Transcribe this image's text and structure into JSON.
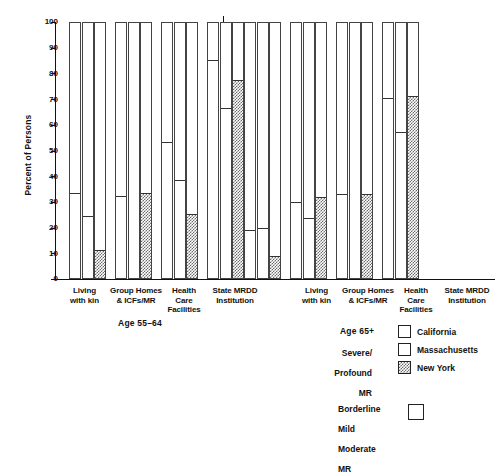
{
  "chart_data": {
    "type": "bar",
    "title": "",
    "ylabel": "Percent of Persons",
    "xlabel": "",
    "ylim": [
      0,
      100
    ],
    "ytick_step": 10,
    "yticks": [
      100,
      90,
      80,
      70,
      60,
      50,
      40,
      30,
      20,
      10,
      0
    ],
    "grid": false,
    "legend_position": "bottom-right",
    "note": "Stacked/overlaid 100% bars; shaded lower portion = Severe/Profound MR, unshaded remainder to 100 = Borderline/Mild/Moderate MR",
    "panels": [
      {
        "name": "Age 55-64",
        "label": "Age 55–64",
        "categories": [
          "Living with kin",
          "Group Homes & ICFs/MR",
          "Health Care Facilities",
          "State MRDD Institution"
        ],
        "series": [
          {
            "name": "California",
            "values": [
              33,
              32,
              53,
              85
            ]
          },
          {
            "name": "Massachusetts",
            "values": [
              24,
              0,
              38,
              66
            ]
          },
          {
            "name": "New York",
            "values": [
              11,
              33,
              25,
              77
            ]
          }
        ]
      },
      {
        "name": "Age 65+",
        "label": "Age 65+",
        "categories": [
          "Living with kin",
          "Group Homes & ICFs/MR",
          "Health Care Facilities",
          "State MRDD Institution"
        ],
        "series": [
          {
            "name": "California",
            "values": [
              18.5,
              29.5,
              32.5,
              70
            ]
          },
          {
            "name": "Massachusetts",
            "values": [
              19.5,
              23.5,
              0,
              57
            ]
          },
          {
            "name": "New York",
            "values": [
              8.5,
              31.5,
              32.5,
              71
            ]
          }
        ]
      }
    ]
  },
  "axis": {
    "ylabel": "Percent of Persons",
    "tick_100": "100",
    "tick_90": "90",
    "tick_80": "80",
    "tick_70": "70",
    "tick_60": "60",
    "tick_50": "50",
    "tick_40": "40",
    "tick_30": "30",
    "tick_20": "20",
    "tick_10": "10",
    "tick_0": "0"
  },
  "categories": {
    "c0_l1": "Living",
    "c0_l2": "with kin",
    "c1_l1": "Group Homes",
    "c1_l2": "& ICFs/MR",
    "c2_l1": "Health",
    "c2_l2": "Care",
    "c2_l3": "Facilities",
    "c3_l1": "State MRDD",
    "c3_l2": "Institution"
  },
  "panel_labels": {
    "left": "Age 55–64",
    "right": "Age 65+"
  },
  "legend": {
    "group_caption_line1": "Severe/",
    "group_caption_line2": "Profound",
    "group_caption_line3": "MR",
    "second_caption_line1": "Borderline",
    "second_caption_line2": "Mild",
    "second_caption_line3": "Moderate",
    "second_caption_line4": "MR",
    "items": [
      {
        "label": "California",
        "pattern": "light-dotted"
      },
      {
        "label": "Massachusetts",
        "pattern": "blank"
      },
      {
        "label": "New York",
        "pattern": "dense-checker"
      }
    ]
  }
}
